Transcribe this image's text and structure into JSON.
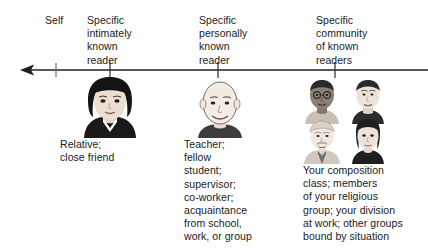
{
  "figure": {
    "name": "audience-continuum-diagram",
    "background_color": "#ffffff",
    "text_color": "#1a1a1a",
    "axis": {
      "name": "leftward-arrow-axis",
      "direction": "left",
      "line_color": "#231f20",
      "tick_count": 4,
      "tick_positions_px": [
        56,
        110,
        218,
        335
      ],
      "arrow_tip_x_px": 20,
      "line_end_x_px": 428,
      "line_y_px": 14
    },
    "top_labels": [
      {
        "name": "label-self",
        "text": "Self"
      },
      {
        "name": "label-specific-intimately-known-reader",
        "text": "Specific\nintimately\nknown\nreader"
      },
      {
        "name": "label-specific-personally-known-reader",
        "text": "Specific\npersonally\nknown\nreader"
      },
      {
        "name": "label-specific-community-of-known-readers",
        "text": "Specific\ncommunity\nof known\nreaders"
      }
    ],
    "bottom_labels": [
      {
        "name": "description-intimately-known-reader",
        "text": "Relative;\nclose friend"
      },
      {
        "name": "description-personally-known-reader",
        "text": "Teacher;\nfellow\nstudent;\nsupervisor;\nco-worker;\nacquaintance\nfrom school,\nwork, or group"
      },
      {
        "name": "description-community-of-known-readers",
        "text": "Your composition\nclass; members\nof your religious\ngroup; your division\nat work; other groups\nbound by situation"
      }
    ],
    "portraits": [
      {
        "name": "portrait-woman-dark-bob",
        "description": "woman with dark bob hair and dark top",
        "hair_color": "#1a1a1a",
        "skin_color": "#e8dcd2",
        "clothing_color": "#1a1a1a"
      },
      {
        "name": "portrait-bald-man",
        "description": "smiling bald man with light skin",
        "hair_color": "#ffffff",
        "skin_color": "#f2ece6",
        "clothing_color": "#3d3d3d"
      },
      {
        "name": "portrait-group-of-four",
        "description": "group of four faces: man with glasses, young man, older man with mustache and tie, woman with dark bob",
        "faces": [
          {
            "name": "group-face-man-with-glasses",
            "skin_color": "#8a7f75",
            "hair_color": "#2b2b2b",
            "clothing_color": "#c9bfb4"
          },
          {
            "name": "group-face-young-man",
            "skin_color": "#ece4db",
            "hair_color": "#2b2b2b",
            "clothing_color": "#2b2b2b"
          },
          {
            "name": "group-face-older-man",
            "skin_color": "#f0e9e2",
            "hair_color": "#d8d2cb",
            "clothing_color": "#d0c8c0"
          },
          {
            "name": "group-face-woman",
            "skin_color": "#ece4db",
            "hair_color": "#1f1f1f",
            "clothing_color": "#1f1f1f"
          }
        ]
      }
    ]
  }
}
